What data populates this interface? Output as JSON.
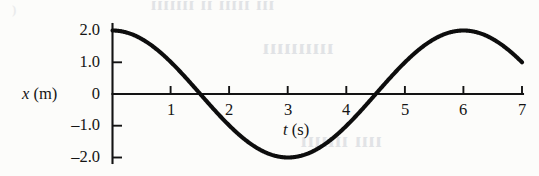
{
  "figure": {
    "name": "position-vs-time-graph",
    "background_color": "#fcfcfa",
    "curve_color": "#0d0d0d",
    "axis_color": "#131313"
  },
  "axes": {
    "y": {
      "title_var": "x",
      "title_unit": "(m)",
      "title": "x (m)",
      "ticks": [
        "2.0",
        "1.0",
        "0",
        "–1.0",
        "–2.0"
      ],
      "tick_values": [
        2.0,
        1.0,
        0,
        -1.0,
        -2.0
      ]
    },
    "x": {
      "title_var": "t",
      "title_unit": "(s)",
      "title": "t (s)",
      "ticks": [
        "1",
        "2",
        "3",
        "4",
        "5",
        "6",
        "7"
      ],
      "tick_values": [
        1,
        2,
        3,
        4,
        5,
        6,
        7
      ]
    }
  },
  "bleed_through": {
    "line1": "ııı ııııı ıı ııııııı",
    "line2": "ıııııııııı",
    "line3": "ıııı ııııııı",
    "corner": ")"
  },
  "chart_data": {
    "type": "line",
    "title": "",
    "xlabel": "t (s)",
    "ylabel": "x (m)",
    "xlim": [
      0,
      7
    ],
    "ylim": [
      -2.2,
      2.2
    ],
    "xticks": [
      1,
      2,
      3,
      4,
      5,
      6,
      7
    ],
    "yticks": [
      -2.0,
      -1.0,
      0,
      1.0,
      2.0
    ],
    "grid": false,
    "legend": null,
    "annotations": [],
    "curve": {
      "name": "simple harmonic motion",
      "equation": "x(t) = 2.0 cos(2πt / 6.0)",
      "amplitude": 2.0,
      "period": 6.0,
      "phase": 0,
      "units": {
        "x": "m",
        "t": "s"
      }
    },
    "x": [
      0,
      0.25,
      0.5,
      0.75,
      1.0,
      1.25,
      1.5,
      1.75,
      2.0,
      2.25,
      2.5,
      2.75,
      3.0,
      3.25,
      3.5,
      3.75,
      4.0,
      4.25,
      4.5,
      4.75,
      5.0,
      5.25,
      5.5,
      5.75,
      6.0,
      6.25,
      6.5,
      6.75,
      7.0
    ],
    "values": [
      2.0,
      1.93,
      1.73,
      1.41,
      1.0,
      0.52,
      0.0,
      -0.52,
      -1.0,
      -1.41,
      -1.73,
      -1.93,
      -2.0,
      -1.93,
      -1.73,
      -1.41,
      -1.0,
      -0.52,
      0.0,
      0.52,
      1.0,
      1.41,
      1.73,
      1.93,
      2.0,
      1.93,
      1.73,
      1.41,
      1.0
    ],
    "key_points": {
      "start": {
        "t": 0,
        "x": 2.0
      },
      "zero_crossings": [
        1.5,
        4.5
      ],
      "minimum": {
        "t": 3.0,
        "x": -2.0
      },
      "maximum": {
        "t": 6.0,
        "x": 2.0
      },
      "end": {
        "t": 7.0,
        "x": 1.0
      }
    }
  }
}
